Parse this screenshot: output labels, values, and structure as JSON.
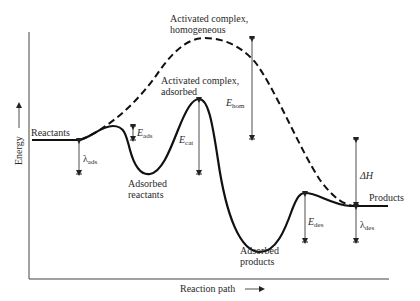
{
  "diagram": {
    "type": "energy-profile",
    "axes": {
      "y_label": "Energy",
      "x_label": "Reaction path"
    },
    "states": {
      "reactants": "Reactants",
      "products": "Products",
      "adsorbed_reactants_line1": "Adsorbed",
      "adsorbed_reactants_line2": "reactants",
      "adsorbed_products_line1": "Adsorbed",
      "adsorbed_products_line2": "products",
      "activated_homogeneous_line1": "Activated complex,",
      "activated_homogeneous_line2": "homogeneous",
      "activated_adsorbed_line1": "Activated complex,",
      "activated_adsorbed_line2": "adsorbed"
    },
    "energies": {
      "e_ads": {
        "symbol": "E",
        "subscript": "ads"
      },
      "e_cat": {
        "symbol": "E",
        "subscript": "cat"
      },
      "e_hom": {
        "symbol": "E",
        "subscript": "hom"
      },
      "e_des": {
        "symbol": "E",
        "subscript": "des"
      },
      "lambda_ads": {
        "symbol": "λ",
        "subscript": "ads"
      },
      "lambda_des": {
        "symbol": "λ",
        "subscript": "des"
      },
      "delta_h": {
        "symbol": "ΔH"
      }
    },
    "curves": {
      "catalyzed": "solid",
      "homogeneous": "dashed"
    },
    "colors": {
      "line": "#111111",
      "text": "#2a2a2a",
      "background": "#ffffff"
    }
  }
}
